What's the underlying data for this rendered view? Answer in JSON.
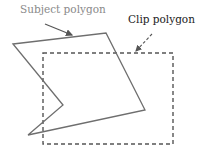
{
  "labels": {
    "subject": "Subject polygon",
    "clip": "Clip polygon"
  },
  "colors": {
    "subject_stroke": "#6e6e6e",
    "clip_stroke": "#555555",
    "subject_label": "#8a8a8a",
    "clip_label": "#222222"
  },
  "subject_polygon": {
    "points": "13,44 106,33 145,110 28,135 63,105"
  },
  "clip_polygon": {
    "points": "43,53 173,53 173,144 43,144"
  }
}
